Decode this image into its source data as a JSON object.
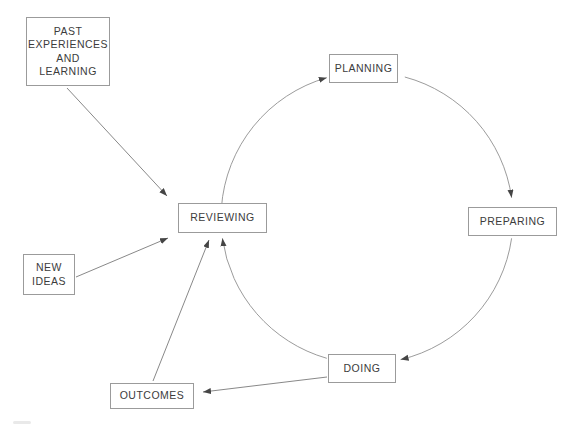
{
  "diagram": {
    "type": "cycle-flow-diagram",
    "background_color": "#ffffff",
    "cycle_stroke_color": "#909090",
    "arrow_stroke_color": "#7a7a7a",
    "arrowhead_color": "#454545",
    "box_border_color": "#9b9b9b",
    "text_color": "#3c3c3c",
    "nodes": {
      "past_experiences": {
        "label": "PAST\nEXPERIENCES\nAND\nLEARNING"
      },
      "planning": {
        "label": "PLANNING"
      },
      "preparing": {
        "label": "PREPARING"
      },
      "doing": {
        "label": "DOING"
      },
      "reviewing": {
        "label": "REVIEWING"
      },
      "new_ideas": {
        "label": "NEW\nIDEAS"
      },
      "outcomes": {
        "label": "OUTCOMES"
      }
    },
    "edges": [
      {
        "from": "REVIEWING",
        "to": "PLANNING",
        "style": "cycle-arc"
      },
      {
        "from": "PLANNING",
        "to": "PREPARING",
        "style": "cycle-arc"
      },
      {
        "from": "PREPARING",
        "to": "DOING",
        "style": "cycle-arc"
      },
      {
        "from": "DOING",
        "to": "REVIEWING",
        "style": "cycle-arc"
      },
      {
        "from": "PAST EXPERIENCES AND LEARNING",
        "to": "REVIEWING",
        "style": "straight"
      },
      {
        "from": "NEW IDEAS",
        "to": "REVIEWING",
        "style": "straight"
      },
      {
        "from": "OUTCOMES",
        "to": "REVIEWING",
        "style": "straight"
      },
      {
        "from": "DOING",
        "to": "OUTCOMES",
        "style": "straight"
      }
    ]
  }
}
